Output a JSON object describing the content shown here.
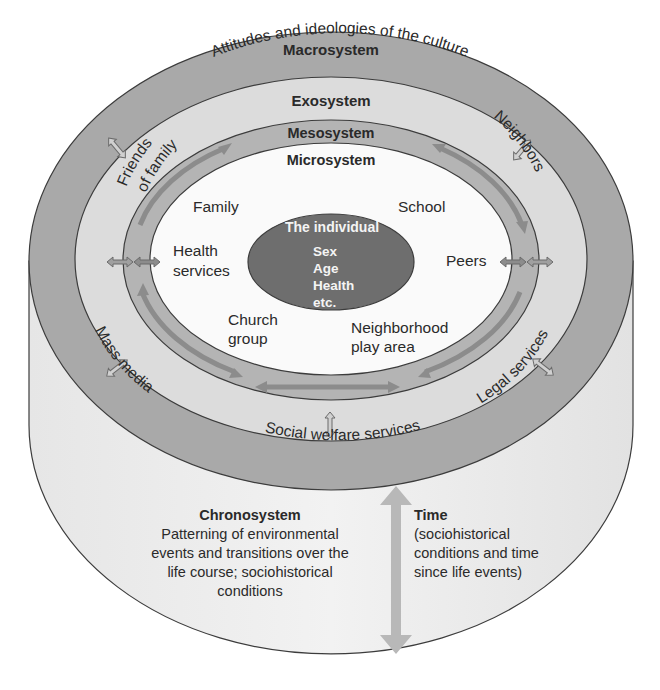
{
  "diagram": {
    "colors": {
      "macro": "#a9a9a9",
      "exo": "#dcdcdc",
      "meso": "#b4b4b4",
      "micro": "#fafafa",
      "individual": "#6e6e6e",
      "cylinder_side": "#ececec",
      "outline": "#3c3c3c",
      "arrow": "#8c8c8c",
      "time_arrow": "#b8b8b8"
    },
    "layers": {
      "macrosystem": {
        "title": "Macrosystem",
        "subtitle": "Attitudes and ideologies of the culture"
      },
      "exosystem": {
        "title": "Exosystem",
        "items": [
          "Friends of family",
          "Neighbors",
          "Mass media",
          "Legal services",
          "Social welfare services"
        ]
      },
      "mesosystem": {
        "title": "Mesosystem"
      },
      "microsystem": {
        "title": "Microsystem",
        "items": {
          "family": "Family",
          "school": "School",
          "health_1": "Health",
          "health_2": "services",
          "peers": "Peers",
          "church_1": "Church",
          "church_2": "group",
          "neighborhood_1": "Neighborhood",
          "neighborhood_2": "play area"
        }
      },
      "individual": {
        "title": "The individual",
        "attributes": [
          "Sex",
          "Age",
          "Health",
          "etc."
        ]
      }
    },
    "exo_labels": {
      "friends_1": "Friends",
      "friends_2": "of family",
      "neighbors": "Neighbors",
      "mass_media": "Mass media",
      "legal": "Legal services",
      "social": "Social welfare services"
    },
    "chronosystem": {
      "title": "Chronosystem",
      "lines": [
        "Patterning of environmental",
        "events and transitions over the",
        "life course; sociohistorical",
        "conditions"
      ]
    },
    "time": {
      "title": "Time",
      "lines": [
        "(sociohistorical",
        "conditions and time",
        "since life events)"
      ]
    }
  }
}
